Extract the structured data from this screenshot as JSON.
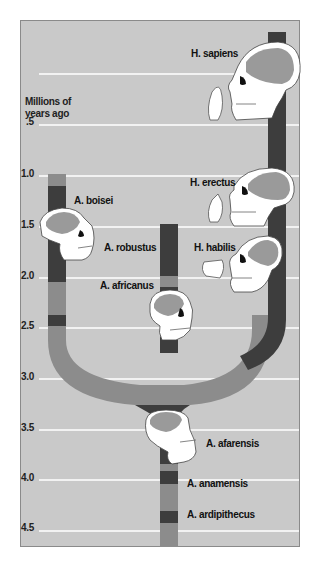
{
  "axis": {
    "title_line1": "Millions of",
    "title_line2": "years ago",
    "ticks": [
      ".5",
      "1.0",
      "1.5",
      "2.0",
      "2.5",
      "3.0",
      "3.5",
      "4.0",
      "4.5"
    ]
  },
  "species": {
    "h_sapiens": "H. sapiens",
    "h_erectus": "H. erectus",
    "h_habilis": "H. habilis",
    "a_boisei": "A. boisei",
    "a_robustus": "A. robustus",
    "a_africanus": "A. africanus",
    "a_afarensis": "A. afarensis",
    "a_anamensis": "A. anamensis",
    "a_ardipithecus": "A. ardipithecus"
  },
  "colors": {
    "background": "#c9c9c9",
    "gridline": "#f2f2f2",
    "dark_bar": "#3d3d3d",
    "light_bar": "#8c8c8c",
    "skull_fill": "#ffffff",
    "braincase": "#9a9a9a"
  }
}
